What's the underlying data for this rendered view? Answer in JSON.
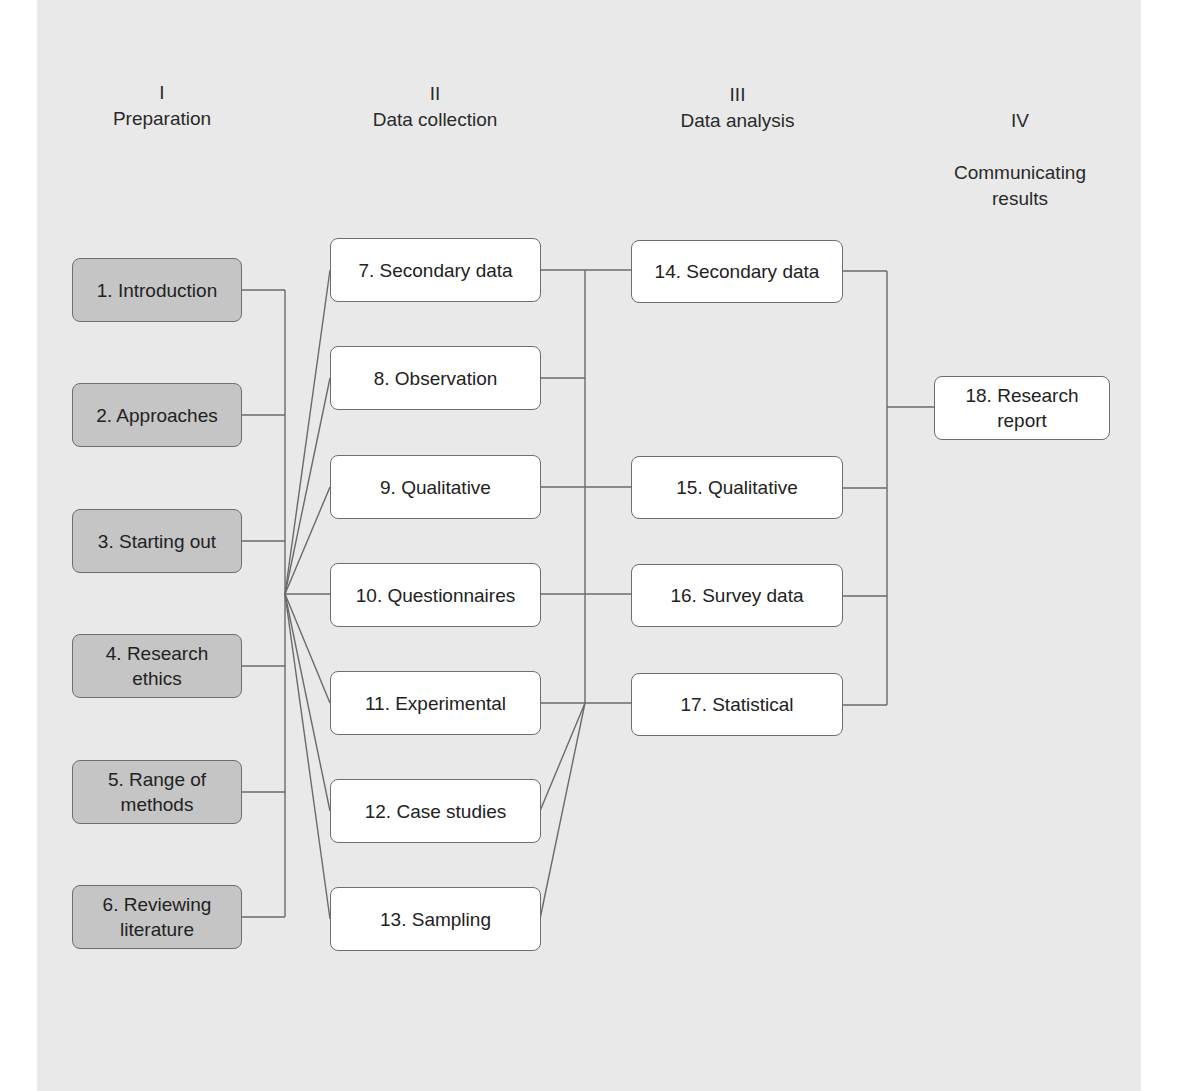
{
  "phases": [
    {
      "numeral": "I",
      "title": "Preparation"
    },
    {
      "numeral": "II",
      "title": "Data collection"
    },
    {
      "numeral": "III",
      "title": "Data analysis"
    },
    {
      "numeral": "IV",
      "title": "Communicating\nresults"
    }
  ],
  "preparation": [
    {
      "label": "1. Introduction"
    },
    {
      "label": "2. Approaches"
    },
    {
      "label": "3. Starting out"
    },
    {
      "label": "4. Research\nethics"
    },
    {
      "label": "5. Range of\nmethods"
    },
    {
      "label": "6. Reviewing\nliterature"
    }
  ],
  "collection": [
    {
      "label": "7. Secondary data"
    },
    {
      "label": "8. Observation"
    },
    {
      "label": "9. Qualitative"
    },
    {
      "label": "10. Questionnaires"
    },
    {
      "label": "11. Experimental"
    },
    {
      "label": "12. Case studies"
    },
    {
      "label": "13. Sampling"
    }
  ],
  "analysis": [
    {
      "label": "14. Secondary data"
    },
    {
      "label": "15. Qualitative"
    },
    {
      "label": "16. Survey data"
    },
    {
      "label": "17. Statistical"
    }
  ],
  "results": [
    {
      "label": "18. Research\nreport"
    }
  ],
  "colors": {
    "panel": "#e9e9e9",
    "preparation_box": "#c5c5c5",
    "other_box": "#ffffff",
    "line": "#6a6a6a"
  }
}
